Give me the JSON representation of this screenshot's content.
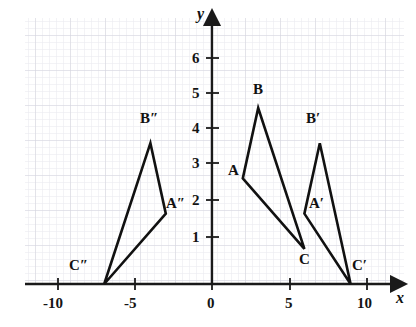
{
  "figure": {
    "kind": "coordinate-plane-diagram",
    "background": "#ffffff",
    "grid": {
      "minor_color": "#e7e7ec",
      "major_color": "#d2d2dc",
      "minor_step_px": 7,
      "major_every": 5,
      "area": {
        "left": 25,
        "top": 18,
        "right": 404,
        "bottom": 285
      }
    },
    "axes": {
      "color": "#1a1a1a",
      "origin_px": {
        "x": 212,
        "y": 284
      },
      "unit_px": {
        "x": 15.4,
        "y": 35.2
      },
      "x_axis": {
        "label": "x",
        "label_pos_px": {
          "x": 398,
          "y": 293
        },
        "ticks": [
          {
            "value": -10,
            "text": "-10"
          },
          {
            "value": -5,
            "text": "-5"
          },
          {
            "value": 0,
            "text": "0"
          },
          {
            "value": 5,
            "text": "5"
          },
          {
            "value": 10,
            "text": "10"
          }
        ]
      },
      "y_axis": {
        "label": "y",
        "label_pos_px": {
          "x": 198,
          "y": 10
        },
        "ticks": [
          {
            "value": 1,
            "text": "1"
          },
          {
            "value": 2,
            "text": "2"
          },
          {
            "value": 3,
            "text": "3"
          },
          {
            "value": 4,
            "text": "4"
          },
          {
            "value": 5,
            "text": "5"
          },
          {
            "value": 6,
            "text": "6"
          }
        ]
      }
    },
    "stroke": {
      "color": "#111111",
      "width": 2.6
    },
    "shapes": [
      {
        "name": "triangle-abc",
        "vertices": [
          {
            "label": "A",
            "x": 2,
            "y": 3
          },
          {
            "label": "B",
            "x": 3,
            "y": 5
          },
          {
            "label": "C",
            "x": 6,
            "y": 1
          }
        ]
      },
      {
        "name": "triangle-a-prime",
        "vertices": [
          {
            "label": "A′",
            "x": 6,
            "y": 2
          },
          {
            "label": "B′",
            "x": 7,
            "y": 4
          },
          {
            "label": "C′",
            "x": 9,
            "y": 0
          }
        ]
      },
      {
        "name": "triangle-a-double-prime",
        "vertices": [
          {
            "label": "A″",
            "x": -3,
            "y": 2
          },
          {
            "label": "B″",
            "x": -4,
            "y": 4
          },
          {
            "label": "C″",
            "x": -7,
            "y": 0
          }
        ]
      }
    ],
    "vertex_labels": [
      {
        "text": "A",
        "px": 199,
        "py": 170
      },
      {
        "text": "B",
        "px": 239,
        "py": 77
      },
      {
        "text": "C",
        "px": 300,
        "py": 252
      },
      {
        "text": "A′",
        "px": 301,
        "py": 197
      },
      {
        "text": "B′",
        "px": 301,
        "py": 107
      },
      {
        "text": "C′",
        "px": 355,
        "py": 258
      },
      {
        "text": "A″",
        "px": 167,
        "py": 199
      },
      {
        "text": "B″",
        "px": 139,
        "py": 111
      },
      {
        "text": "C″",
        "px": 69,
        "py": 258
      }
    ]
  }
}
